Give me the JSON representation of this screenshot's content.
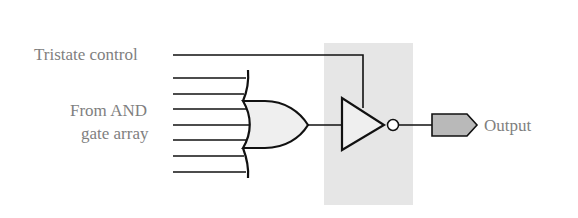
{
  "diagram": {
    "labels": {
      "tristate_control": "Tristate control",
      "inputs_line1": "From AND",
      "inputs_line2": "gate array",
      "output": "Output"
    },
    "components": [
      {
        "id": "or-gate",
        "type": "OR gate",
        "inputs": 7
      },
      {
        "id": "tristate-buffer",
        "type": "tristate inverting buffer"
      },
      {
        "id": "output-pin",
        "type": "output connector"
      }
    ],
    "colors": {
      "stroke": "#111111",
      "label": "#7f7f7f",
      "shade": "#e6e6e6",
      "gate_fill": "#efefef",
      "pin_fill": "#b9b9b9"
    }
  }
}
